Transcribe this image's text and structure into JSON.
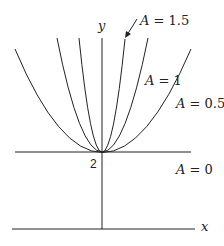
{
  "figure": {
    "axis_labels": {
      "x": "x",
      "y": "y"
    },
    "vertex_label": "2",
    "curve_labels": [
      {
        "name": "A",
        "eq": "=",
        "value": "1.5"
      },
      {
        "name": "A",
        "eq": "=",
        "value": "1"
      },
      {
        "name": "A",
        "eq": "=",
        "value": "0.5"
      },
      {
        "name": "A",
        "eq": "=",
        "value": "0"
      }
    ],
    "colors": {
      "stroke": "#222222",
      "background": "#ffffff"
    }
  }
}
